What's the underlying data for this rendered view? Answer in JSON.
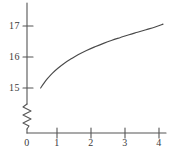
{
  "chart_data": {
    "type": "line",
    "title": "",
    "subtitle": "",
    "xlabel": "",
    "ylabel": "",
    "xlim": [
      0,
      4.2
    ],
    "ylim": [
      15,
      17.3
    ],
    "grid": false,
    "legend": null,
    "axis_break": {
      "axis": "y",
      "symbol": "zigzag",
      "below_value": 15,
      "note": "y-axis broken between 0 and 15"
    },
    "x_ticks": [
      {
        "value": 0,
        "label": "0"
      },
      {
        "value": 1,
        "label": "1"
      },
      {
        "value": 2,
        "label": "2"
      },
      {
        "value": 3,
        "label": "3"
      },
      {
        "value": 4,
        "label": "4"
      }
    ],
    "y_ticks": [
      {
        "value": 15,
        "label": "15"
      },
      {
        "value": 16,
        "label": "16"
      },
      {
        "value": 17,
        "label": "17"
      }
    ],
    "series": [
      {
        "name": "curve",
        "color": "#4a4a4a",
        "x": [
          0.4,
          0.5,
          0.6,
          0.75,
          0.9,
          1.1,
          1.3,
          1.5,
          1.75,
          2.0,
          2.25,
          2.5,
          2.75,
          3.0,
          3.25,
          3.5,
          3.75,
          4.0
        ],
        "y": [
          15.0,
          15.16,
          15.3,
          15.48,
          15.63,
          15.8,
          15.94,
          16.07,
          16.21,
          16.33,
          16.44,
          16.54,
          16.63,
          16.72,
          16.8,
          16.88,
          16.96,
          17.06
        ]
      }
    ]
  },
  "axes": {
    "origin_label": "0",
    "y_axis_name": "y-axis",
    "x_axis_name": "x-axis"
  },
  "labels": {
    "y": [
      "17",
      "16",
      "15"
    ],
    "x": [
      "0",
      "1",
      "2",
      "3",
      "4"
    ]
  },
  "colors": {
    "ink": "#4a4a4a",
    "background": "#ffffff",
    "text": "#3a3a3a"
  }
}
